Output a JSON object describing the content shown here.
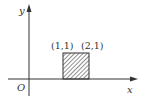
{
  "diagram": {
    "axes": {
      "x_label": "x",
      "y_label": "y",
      "origin_label": "O"
    },
    "points": [
      {
        "label": "(1,1)"
      },
      {
        "label": "(2,1)"
      }
    ],
    "region": {
      "description": "shaded square from x=1 to x=2, y=0 to y=1",
      "fill": "hatched",
      "color": "#333333"
    }
  }
}
